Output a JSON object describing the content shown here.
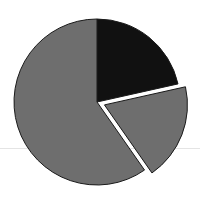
{
  "chart_data": {
    "type": "pie",
    "title": "",
    "legend": [],
    "start_angle_deg": 0,
    "direction": "clockwise",
    "slices": [
      {
        "label": "",
        "value": 21.5,
        "color": "#111111",
        "exploded": false
      },
      {
        "label": "",
        "value": 18.8,
        "color": "#6e6e6e",
        "exploded": true
      },
      {
        "label": "",
        "value": 59.7,
        "color": "#6e6e6e",
        "exploded": false
      }
    ],
    "stroke_color": "#1a1a1a",
    "explode_offset_px": 8
  },
  "layout": {
    "cx": 97,
    "cy": 102,
    "r": 83
  }
}
